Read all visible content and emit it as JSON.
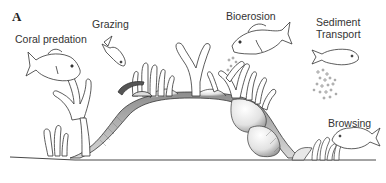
{
  "figure": {
    "panel_label": "A",
    "labels": {
      "coral_predation": "Coral predation",
      "grazing": "Grazing",
      "bioerosion": "Bioerosion",
      "sediment_transport_line1": "Sediment",
      "sediment_transport_line2": "Transport",
      "browsing": "Browsing"
    },
    "colors": {
      "line": "#333333",
      "shade": "#9a9a9a",
      "background": "#ffffff"
    }
  }
}
